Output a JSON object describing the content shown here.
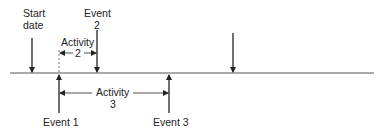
{
  "diagram": {
    "colors": {
      "line": "#555555",
      "arrow": "#222222",
      "text": "#222222",
      "background": "#ffffff"
    },
    "labels": {
      "start_date": [
        "Start",
        "date"
      ],
      "event2": [
        "Event",
        "2"
      ],
      "activity2": [
        "Activity",
        "2"
      ],
      "activity3": [
        "Activity",
        "3"
      ],
      "event1": "Event 1",
      "event3": "Event 3"
    }
  }
}
